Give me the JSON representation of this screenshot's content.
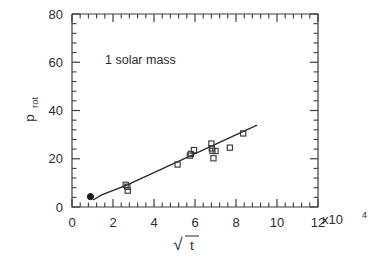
{
  "figure": {
    "background_color": "#ffffff",
    "ink_color": "#2b2b2b"
  },
  "annotation": {
    "text": "1  solar mass"
  },
  "axes": {
    "x": {
      "label_root": "t",
      "label_symbol": "√",
      "tick_labels": [
        "0",
        "2",
        "4",
        "6",
        "8",
        "10",
        "12"
      ],
      "tick_values": [
        0,
        2,
        4,
        6,
        8,
        10,
        12
      ],
      "exponent_mantissa": "x10",
      "exponent_power": "4",
      "min": 0,
      "max": 12,
      "minor_per_major": 4
    },
    "y": {
      "label_main": "p",
      "label_sub": "rot",
      "tick_labels": [
        "0",
        "20",
        "40",
        "60",
        "80"
      ],
      "tick_values": [
        0,
        20,
        40,
        60,
        80
      ],
      "min": 0,
      "max": 80,
      "minor_per_major": 4
    }
  },
  "chart_data": {
    "type": "scatter",
    "title": "",
    "subtitle": "",
    "xlabel": "√t",
    "ylabel": "p_rot",
    "xlim": [
      0,
      12
    ],
    "ylim": [
      0,
      80
    ],
    "x_units": "x10^4",
    "grid": false,
    "legend": null,
    "annotations": [
      {
        "text": "1  solar mass",
        "x": 1.6,
        "y": 62
      }
    ],
    "series": [
      {
        "name": "filled point",
        "marker": "filled-circle",
        "points": [
          {
            "x": 0.9,
            "y": 4.3
          }
        ]
      },
      {
        "name": "open squares",
        "marker": "open-square",
        "points": [
          {
            "x": 2.62,
            "y": 9.2
          },
          {
            "x": 2.7,
            "y": 8.4
          },
          {
            "x": 2.72,
            "y": 6.8
          },
          {
            "x": 5.15,
            "y": 17.6
          },
          {
            "x": 5.75,
            "y": 21.3
          },
          {
            "x": 5.8,
            "y": 22.0
          },
          {
            "x": 5.95,
            "y": 23.6
          },
          {
            "x": 6.8,
            "y": 26.3
          },
          {
            "x": 6.82,
            "y": 24.3
          },
          {
            "x": 6.85,
            "y": 23.3
          },
          {
            "x": 7.0,
            "y": 23.2
          },
          {
            "x": 6.9,
            "y": 20.2
          },
          {
            "x": 7.7,
            "y": 24.6
          },
          {
            "x": 8.35,
            "y": 30.5
          }
        ]
      }
    ],
    "fit_line": {
      "name": "trend",
      "type": "line",
      "points": [
        {
          "x": 1.05,
          "y": 3.0
        },
        {
          "x": 1.45,
          "y": 5.0
        },
        {
          "x": 2.7,
          "y": 9.2
        },
        {
          "x": 9.0,
          "y": 33.8
        }
      ]
    }
  }
}
